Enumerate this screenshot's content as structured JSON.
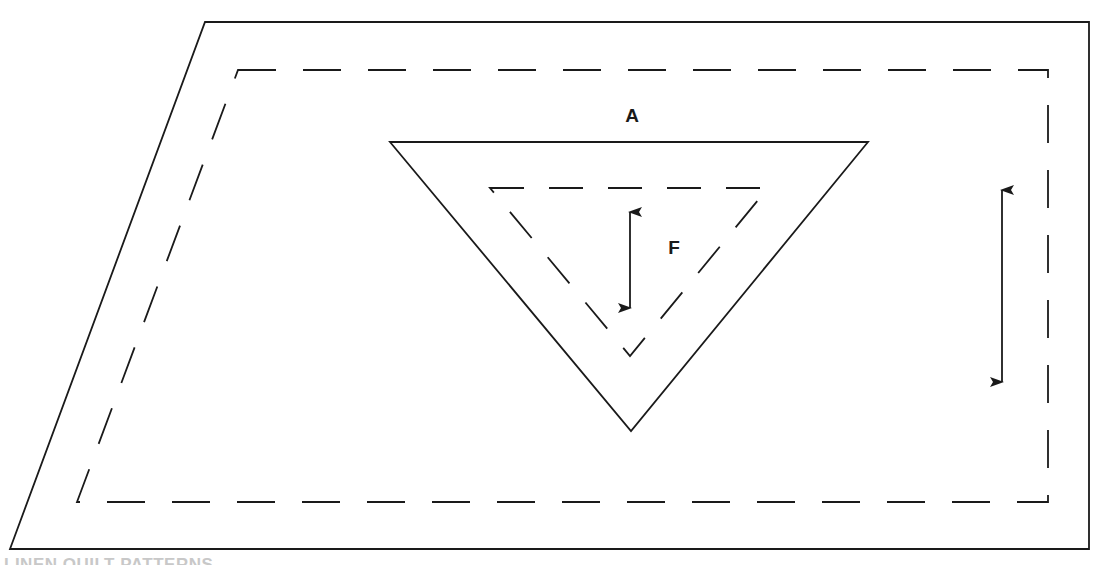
{
  "diagram": {
    "labels": {
      "piece_a": "A",
      "piece_f": "F"
    },
    "caption": "LINEN QUILT PATTERNS",
    "colors": {
      "line": "#1a1a1a",
      "background": "#ffffff",
      "caption": "#c8c8c8"
    },
    "shapes": {
      "outer_cut_line": {
        "type": "parallelogram",
        "stroke": "solid",
        "points": [
          [
            205,
            22
          ],
          [
            1089,
            22
          ],
          [
            1089,
            549
          ],
          [
            10,
            549
          ]
        ]
      },
      "outer_seam_line": {
        "type": "parallelogram",
        "stroke": "dashed",
        "points": [
          [
            238,
            70
          ],
          [
            1048,
            70
          ],
          [
            1048,
            502
          ],
          [
            77,
            502
          ]
        ]
      },
      "triangle_a_cut_line": {
        "type": "triangle",
        "stroke": "solid",
        "points": [
          [
            390,
            142
          ],
          [
            868,
            142
          ],
          [
            631,
            431
          ]
        ]
      },
      "triangle_f_seam_line": {
        "type": "triangle",
        "stroke": "dashed",
        "points": [
          [
            490,
            188
          ],
          [
            768,
            188
          ],
          [
            630,
            356
          ]
        ]
      }
    },
    "grain_arrows": [
      {
        "name": "grain-arrow-piece-f",
        "x": 630,
        "y1": 210,
        "y2": 310
      },
      {
        "name": "grain-arrow-piece-a",
        "x": 1002,
        "y1": 188,
        "y2": 384
      }
    ]
  }
}
